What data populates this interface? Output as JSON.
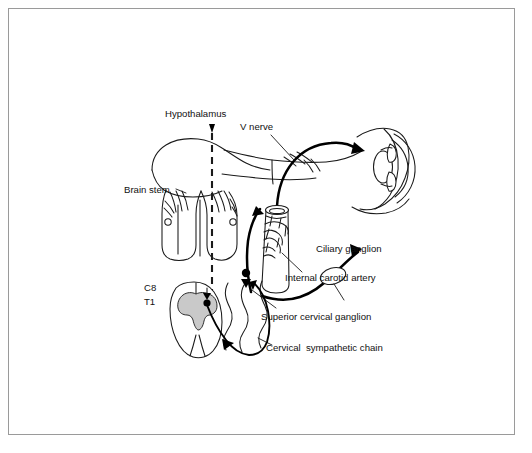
{
  "figure": {
    "background_color": "#ffffff",
    "frame_color": "#9a9a9a",
    "ink_color": "#1a1a1a",
    "gray_matter_color": "#c9c9c9",
    "nerve_color": "#000000"
  },
  "labels": {
    "hypothalamus": "Hypothalamus",
    "v_nerve": "V nerve",
    "brain_stem": "Brain stem",
    "ciliary_ganglion": "Ciliary ganglion",
    "internal_carotid_artery": "Internal carotid artery",
    "superior_cervical_ganglion": "Superior cervical ganglion",
    "cervical_sympathetic_chain": "Cervical  sympathetic chain",
    "spinal_level_c8": "C8",
    "spinal_level_t1": "T1"
  },
  "structures": [
    {
      "name": "hypothalamus-descending-tract",
      "kind": "dashed-midline"
    },
    {
      "name": "brain-stem",
      "kind": "outline"
    },
    {
      "name": "trigeminal-v-nerve",
      "kind": "outline"
    },
    {
      "name": "eye-globe",
      "kind": "outline"
    },
    {
      "name": "eye-lens",
      "kind": "outline"
    },
    {
      "name": "cornea",
      "kind": "outline"
    },
    {
      "name": "ciliary-ganglion",
      "kind": "ganglion"
    },
    {
      "name": "internal-carotid-artery",
      "kind": "vessel"
    },
    {
      "name": "carotid-nerve-plexus",
      "kind": "plexus"
    },
    {
      "name": "superior-cervical-ganglion",
      "kind": "ganglion"
    },
    {
      "name": "cervical-sympathetic-chain",
      "kind": "chain"
    },
    {
      "name": "spinal-cord-c8-t1",
      "kind": "spinal-cord"
    },
    {
      "name": "spinal-gray-matter",
      "kind": "gray-matter"
    },
    {
      "name": "preganglionic-fiber",
      "kind": "nerve-fiber"
    },
    {
      "name": "postganglionic-fiber",
      "kind": "nerve-fiber"
    }
  ]
}
